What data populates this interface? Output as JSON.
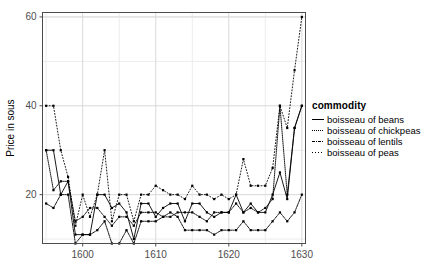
{
  "chart_data": {
    "type": "line",
    "title": "",
    "xlabel": "",
    "ylabel": "Price in sous",
    "xlim": [
      1594.5,
      1630.5
    ],
    "ylim": [
      9,
      61
    ],
    "xticks": [
      1600,
      1610,
      1620,
      1630
    ],
    "yticks": [
      20,
      40,
      60
    ],
    "grid": true,
    "legend_title": "commodity",
    "legend_position": "right",
    "markers": "filled-square",
    "series": [
      {
        "name": "boisseau of beans",
        "style": "solid",
        "x": [
          1595,
          1596,
          1597,
          1598,
          1599,
          1600,
          1601,
          1602,
          1603,
          1604,
          1605,
          1606,
          1607,
          1608,
          1609,
          1610,
          1611,
          1612,
          1613,
          1614,
          1615,
          1616,
          1617,
          1618,
          1619,
          1620,
          1621,
          1622,
          1623,
          1624,
          1625,
          1626,
          1627,
          1628,
          1629,
          1630
        ],
        "values": [
          30,
          30,
          20,
          23,
          11,
          11,
          11,
          20,
          20,
          17,
          18,
          16,
          10,
          18,
          18,
          15,
          17,
          18,
          18,
          14,
          18,
          18,
          16,
          15,
          16,
          16,
          20,
          16,
          18,
          16,
          16,
          20,
          25,
          19,
          35,
          40
        ]
      },
      {
        "name": "boisseau of chickpeas",
        "style": "fine-dotted",
        "x": [
          1595,
          1596,
          1597,
          1598,
          1599,
          1600,
          1601,
          1602,
          1603,
          1604,
          1605,
          1606,
          1607,
          1608,
          1609,
          1610,
          1611,
          1612,
          1613,
          1614,
          1615,
          1616,
          1617,
          1618,
          1619,
          1620,
          1621,
          1622,
          1623,
          1624,
          1625,
          1626,
          1627,
          1628,
          1629,
          1630
        ],
        "values": [
          30,
          21,
          23,
          23,
          14,
          15,
          17,
          17,
          15,
          13,
          15,
          15,
          13,
          16,
          16,
          16,
          15,
          15,
          16,
          16,
          16,
          15,
          14,
          16,
          16,
          16,
          18,
          16,
          17,
          16,
          17,
          19,
          40,
          20,
          35,
          40
        ]
      },
      {
        "name": "boisseau of lentils",
        "style": "dash-dot",
        "x": [
          1595,
          1596,
          1597,
          1598,
          1599,
          1600,
          1601,
          1602,
          1603,
          1604,
          1605,
          1606,
          1607,
          1608,
          1609,
          1610,
          1611,
          1612,
          1613,
          1614,
          1615,
          1616,
          1617,
          1618,
          1619,
          1620,
          1621,
          1622,
          1623,
          1624,
          1625,
          1626,
          1627,
          1628,
          1629,
          1630
        ],
        "values": [
          18,
          17,
          20,
          20,
          9,
          11,
          11,
          12,
          14,
          9,
          9,
          12,
          9,
          14,
          14,
          14,
          15,
          16,
          15,
          12,
          12,
          12,
          12,
          11,
          12,
          12,
          12,
          14,
          12,
          12,
          12,
          14,
          16,
          14,
          16,
          20
        ]
      },
      {
        "name": "boisseau of peas",
        "style": "dotted",
        "x": [
          1595,
          1596,
          1597,
          1598,
          1599,
          1600,
          1601,
          1602,
          1603,
          1604,
          1605,
          1606,
          1607,
          1608,
          1609,
          1610,
          1611,
          1612,
          1613,
          1614,
          1615,
          1616,
          1617,
          1618,
          1619,
          1620,
          1621,
          1622,
          1623,
          1624,
          1625,
          1626,
          1627,
          1628,
          1629,
          1630
        ],
        "values": [
          40,
          40,
          30,
          24,
          13,
          20,
          15,
          20,
          30,
          14,
          20,
          20,
          14,
          20,
          20,
          22,
          21,
          20,
          20,
          19,
          22,
          20,
          20,
          19,
          20,
          19,
          20,
          28,
          22,
          22,
          22,
          26,
          40,
          35,
          48,
          60
        ]
      }
    ]
  },
  "axes": {
    "y_title": "Price in sous",
    "x_tick_labels": [
      "1600",
      "1610",
      "1620",
      "1630"
    ],
    "y_tick_labels": [
      "20",
      "40",
      "60"
    ]
  },
  "legend": {
    "title": "commodity",
    "items": [
      {
        "label": "boisseau of beans",
        "key": "solid-line-key"
      },
      {
        "label": "boisseau of chickpeas",
        "key": "fine-dotted-line-key"
      },
      {
        "label": "boisseau of lentils",
        "key": "dash-dot-line-key"
      },
      {
        "label": "boisseau of peas",
        "key": "dotted-line-key"
      }
    ]
  },
  "colors": {
    "line": "#000000",
    "panel_border": "#4d4d4d",
    "grid_major": "#d9d9d9",
    "grid_minor": "#ececec",
    "background": "#ffffff",
    "tick_label": "#4d4d4d"
  }
}
